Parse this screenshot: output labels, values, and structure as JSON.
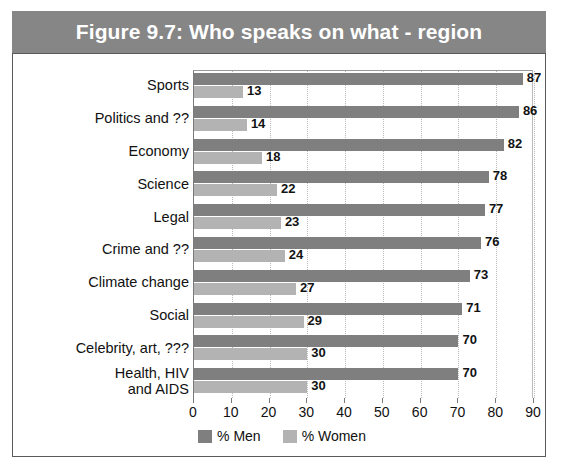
{
  "chart_data": {
    "type": "bar",
    "orientation": "horizontal",
    "title": "Figure 9.7: Who speaks on what - region",
    "xlabel": "",
    "ylabel": "",
    "xlim": [
      0,
      90
    ],
    "xticks": [
      0,
      10,
      20,
      30,
      40,
      50,
      60,
      70,
      80,
      90
    ],
    "grid": true,
    "legend_position": "bottom",
    "categories": [
      "Sports",
      "Politics and ??",
      "Economy",
      "Science",
      "Legal",
      "Crime and ??",
      "Climate change",
      "Social",
      "Celebrity, art, ???",
      "Health, HIV\nand AIDS"
    ],
    "series": [
      {
        "name": "% Men",
        "color": "#7f7f7f",
        "values": [
          87,
          86,
          82,
          78,
          77,
          76,
          73,
          71,
          70,
          70
        ]
      },
      {
        "name": "% Women",
        "color": "#b3b3b3",
        "values": [
          13,
          14,
          18,
          22,
          23,
          24,
          27,
          29,
          30,
          30
        ]
      }
    ]
  },
  "colors": {
    "title_bar_background": "#868686",
    "title_text": "#ffffff",
    "frame_border": "#5a5a5a",
    "plot_background": "#ffffff",
    "gridline": "#b8b8b8",
    "men_bar": "#7f7f7f",
    "women_bar": "#b3b3b3"
  }
}
